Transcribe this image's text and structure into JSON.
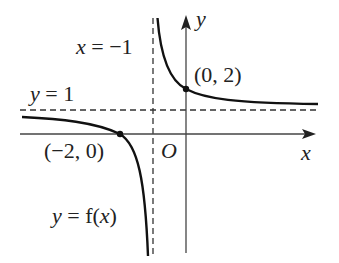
{
  "diagram": {
    "type": "function-graph",
    "function_label": "y = f(x)",
    "axes": {
      "x_label": "x",
      "y_label": "y",
      "origin_label": "O"
    },
    "asymptotes": {
      "vertical": {
        "label": "x = −1",
        "value": -1
      },
      "horizontal": {
        "label": "y = 1",
        "value": 1
      }
    },
    "points": [
      {
        "label": "(0, 2)",
        "x": 0,
        "y": 2
      },
      {
        "label": "(−2, 0)",
        "x": -2,
        "y": 0
      }
    ],
    "colors": {
      "curve": "#111111",
      "axes": "#333333",
      "dashed": "#333333",
      "text": "#222222"
    }
  },
  "labels": {
    "vert_asym": {
      "var": "x",
      "rest": " = −1"
    },
    "horiz_asym": {
      "var": "y",
      "rest": " = 1"
    },
    "point_a": "(0, 2)",
    "point_b": "(−2, 0)",
    "origin": "O",
    "x_axis": "x",
    "y_axis": "y",
    "func": {
      "var": "y",
      "eq": " = f(",
      "arg": "x",
      "close": ")"
    }
  }
}
